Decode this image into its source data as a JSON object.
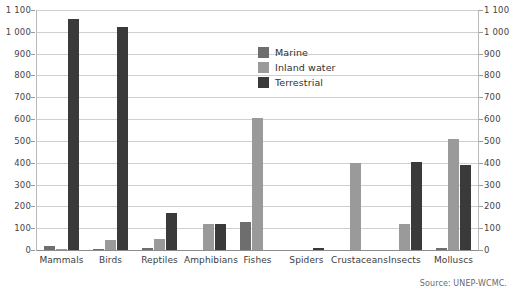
{
  "chart_data": {
    "type": "bar",
    "title": "",
    "subtitle": "",
    "xlabel": "",
    "ylabel": "",
    "ylim": [
      0,
      1100
    ],
    "ytick_step": 100,
    "ytick_labels": [
      "0",
      "100",
      "200",
      "300",
      "400",
      "500",
      "600",
      "700",
      "800",
      "900",
      "1 000",
      "1 100"
    ],
    "grid": true,
    "dual_axis": true,
    "legend_position": "upper-center",
    "categories": [
      "Mammals",
      "Birds",
      "Reptiles",
      "Amphibians",
      "Fishes",
      "Spiders",
      "Crustaceans",
      "Insects",
      "Molluscs"
    ],
    "series": [
      {
        "name": "Marine",
        "color": "#6e6e6e",
        "values": [
          20,
          5,
          10,
          0,
          130,
          0,
          0,
          0,
          10
        ]
      },
      {
        "name": "Inland water",
        "color": "#9a9a9a",
        "values": [
          5,
          45,
          50,
          120,
          605,
          0,
          400,
          120,
          510
        ]
      },
      {
        "name": "Terrestrial",
        "color": "#3a3a3a",
        "values": [
          1060,
          1020,
          170,
          120,
          0,
          10,
          0,
          405,
          390
        ]
      }
    ],
    "source": "Source: UNEP-WCMC."
  },
  "legend": {
    "items": [
      {
        "label": "Marine"
      },
      {
        "label": "Inland water"
      },
      {
        "label": "Terrestrial"
      }
    ]
  }
}
